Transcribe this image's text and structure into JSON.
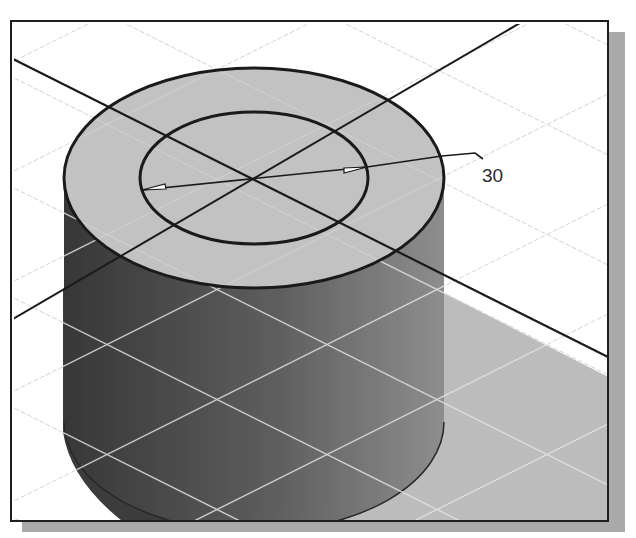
{
  "figure": {
    "type": "cad-3d-viewport"
  },
  "dimension": {
    "label": "30",
    "type": "diameter",
    "leader_points": [
      [
        365,
        165
      ],
      [
        440,
        154
      ],
      [
        473,
        151
      ],
      [
        481,
        157
      ]
    ],
    "arrow_a": [
      140,
      188
    ],
    "arrow_b": [
      365,
      165
    ],
    "label_pos": [
      480,
      180
    ]
  },
  "colors": {
    "frame": "#1e1e1e",
    "frame_shadow": "#a9a9a9",
    "background": "#ffffff",
    "grid_line": "#d6d6d6",
    "grid_line_on_shade": "#e2e2e2",
    "top_face": "#c2c2c2",
    "cylinder_side_dark": "#383838",
    "cylinder_side_light": "#8e8e8e",
    "ground_plane": "#bcbcbc",
    "cast_shadow": "#3d3d3d",
    "edge": "#1a1a1a"
  },
  "geometry": {
    "top_center": [
      252,
      176
    ],
    "outer_rx": 190,
    "outer_ry": 110,
    "inner_rx": 114,
    "inner_ry": 66,
    "cylinder_height": 240,
    "axis_1": [
      [
        11,
        57
      ],
      [
        620,
        362
      ]
    ],
    "axis_2": [
      [
        518,
        21
      ],
      [
        11,
        317
      ]
    ]
  }
}
